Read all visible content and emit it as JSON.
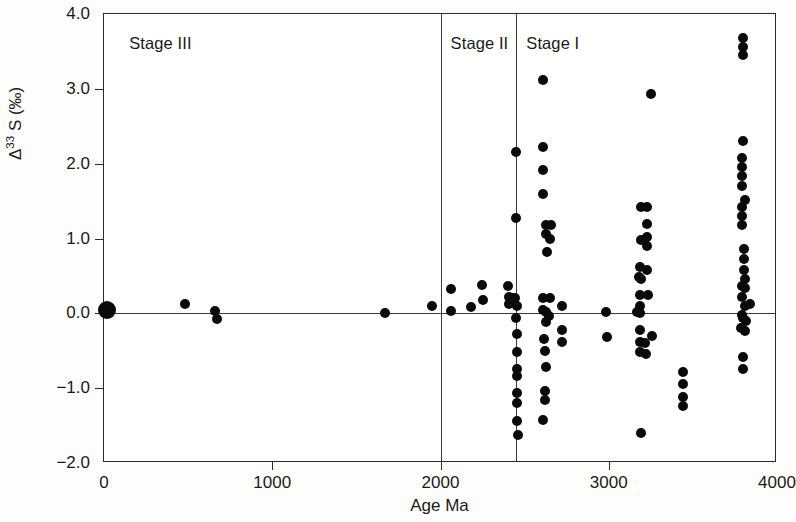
{
  "chart_data": {
    "type": "scatter",
    "title": "",
    "xlabel": "Age Ma",
    "ylabel": "Δ33 S (‰)",
    "ylabel_base": "Δ",
    "ylabel_sup": "33",
    "ylabel_rest": " S (‰)",
    "xlim": [
      0,
      4000
    ],
    "ylim": [
      -2.0,
      4.0
    ],
    "xticks": [
      0,
      1000,
      2000,
      3000,
      4000
    ],
    "xtick_labels": [
      "0",
      "1000",
      "2000",
      "3000",
      "4000"
    ],
    "yticks": [
      -2.0,
      -1.0,
      0.0,
      1.0,
      2.0,
      3.0,
      4.0
    ],
    "ytick_labels": [
      "-2.0",
      "-1.0",
      "0.0",
      "1.0",
      "2.0",
      "3.0",
      "4.0"
    ],
    "grid": false,
    "legend": null,
    "zero_line": 0.0,
    "point_color": "#0a0a0a",
    "frame_color": "#2b2b2b",
    "annotations": [
      {
        "name": "stage-iii-label",
        "text": "Stage III",
        "x": 150,
        "y": 3.72
      },
      {
        "name": "stage-ii-label",
        "text": "Stage II",
        "x": 2060,
        "y": 3.72
      },
      {
        "name": "stage-i-label",
        "text": "Stage I",
        "x": 2510,
        "y": 3.72
      }
    ],
    "dividers": [
      {
        "name": "stage-iii-ii-divider",
        "x": 2000
      },
      {
        "name": "stage-ii-i-divider",
        "x": 2450
      }
    ],
    "series": [
      {
        "name": "Phanerozoic-Proterozoic",
        "points": [
          {
            "x": 20,
            "y": 0.05,
            "r": 9
          },
          {
            "x": 480,
            "y": 0.13,
            "r": 5
          },
          {
            "x": 660,
            "y": 0.03,
            "r": 5
          },
          {
            "x": 672,
            "y": -0.07,
            "r": 5
          },
          {
            "x": 1670,
            "y": 0.0,
            "r": 5
          },
          {
            "x": 1950,
            "y": 0.1,
            "r": 5
          }
        ]
      },
      {
        "name": "Stage-II-2050-2450",
        "points": [
          {
            "x": 2060,
            "y": 0.32,
            "r": 5
          },
          {
            "x": 2062,
            "y": 0.03,
            "r": 5
          },
          {
            "x": 2180,
            "y": 0.08,
            "r": 5
          },
          {
            "x": 2245,
            "y": 0.38,
            "r": 5
          },
          {
            "x": 2250,
            "y": 0.18,
            "r": 5
          },
          {
            "x": 2400,
            "y": 0.36,
            "r": 5
          },
          {
            "x": 2405,
            "y": 0.22,
            "r": 5
          },
          {
            "x": 2410,
            "y": 0.12,
            "r": 5
          },
          {
            "x": 2432,
            "y": 0.2,
            "r": 5
          },
          {
            "x": 2445,
            "y": 0.2,
            "r": 5
          },
          {
            "x": 2450,
            "y": -0.06,
            "r": 5
          }
        ]
      },
      {
        "name": "Stage-I-2450-boundary-column",
        "points": [
          {
            "x": 2450,
            "y": 2.16,
            "r": 5
          },
          {
            "x": 2450,
            "y": 1.28,
            "r": 5
          },
          {
            "x": 2455,
            "y": 0.1,
            "r": 5
          },
          {
            "x": 2455,
            "y": -0.28,
            "r": 5
          },
          {
            "x": 2455,
            "y": -0.52,
            "r": 5
          },
          {
            "x": 2455,
            "y": -0.74,
            "r": 5
          },
          {
            "x": 2455,
            "y": -0.84,
            "r": 5
          },
          {
            "x": 2455,
            "y": -1.06,
            "r": 5
          },
          {
            "x": 2455,
            "y": -1.2,
            "r": 5
          },
          {
            "x": 2455,
            "y": -1.44,
            "r": 5
          },
          {
            "x": 2458,
            "y": -1.62,
            "r": 5
          }
        ]
      },
      {
        "name": "Stage-I-2550-2750",
        "points": [
          {
            "x": 2608,
            "y": 3.12,
            "r": 5
          },
          {
            "x": 2608,
            "y": 2.22,
            "r": 5
          },
          {
            "x": 2608,
            "y": 1.92,
            "r": 5
          },
          {
            "x": 2610,
            "y": 1.6,
            "r": 5
          },
          {
            "x": 2630,
            "y": 1.18,
            "r": 5
          },
          {
            "x": 2655,
            "y": 1.18,
            "r": 5
          },
          {
            "x": 2625,
            "y": 1.06,
            "r": 5
          },
          {
            "x": 2648,
            "y": 1.0,
            "r": 5
          },
          {
            "x": 2632,
            "y": 0.82,
            "r": 5
          },
          {
            "x": 2610,
            "y": 0.2,
            "r": 5
          },
          {
            "x": 2648,
            "y": 0.2,
            "r": 5
          },
          {
            "x": 2612,
            "y": 0.04,
            "r": 5
          },
          {
            "x": 2630,
            "y": 0.02,
            "r": 5
          },
          {
            "x": 2645,
            "y": -0.04,
            "r": 5
          },
          {
            "x": 2625,
            "y": -0.12,
            "r": 5
          },
          {
            "x": 2618,
            "y": -0.34,
            "r": 5
          },
          {
            "x": 2620,
            "y": -0.5,
            "r": 5
          },
          {
            "x": 2625,
            "y": -0.72,
            "r": 5
          },
          {
            "x": 2622,
            "y": -1.04,
            "r": 5
          },
          {
            "x": 2624,
            "y": -1.16,
            "r": 5
          },
          {
            "x": 2612,
            "y": -1.42,
            "r": 5
          },
          {
            "x": 2720,
            "y": 0.1,
            "r": 5
          },
          {
            "x": 2722,
            "y": -0.22,
            "r": 5
          },
          {
            "x": 2722,
            "y": -0.38,
            "r": 5
          }
        ]
      },
      {
        "name": "Stage-I-2950-3050",
        "points": [
          {
            "x": 2985,
            "y": 0.02,
            "r": 5
          },
          {
            "x": 2990,
            "y": -0.32,
            "r": 5
          }
        ]
      },
      {
        "name": "Stage-I-3150-3300",
        "points": [
          {
            "x": 3250,
            "y": 2.93,
            "r": 5
          },
          {
            "x": 3190,
            "y": 1.42,
            "r": 5
          },
          {
            "x": 3225,
            "y": 1.42,
            "r": 5
          },
          {
            "x": 3228,
            "y": 1.2,
            "r": 5
          },
          {
            "x": 3228,
            "y": 1.02,
            "r": 5
          },
          {
            "x": 3192,
            "y": 0.98,
            "r": 5
          },
          {
            "x": 3228,
            "y": 0.9,
            "r": 5
          },
          {
            "x": 3185,
            "y": 0.62,
            "r": 5
          },
          {
            "x": 3225,
            "y": 0.58,
            "r": 5
          },
          {
            "x": 3178,
            "y": 0.48,
            "r": 5
          },
          {
            "x": 3190,
            "y": 0.46,
            "r": 5
          },
          {
            "x": 3188,
            "y": 0.24,
            "r": 5
          },
          {
            "x": 3232,
            "y": 0.24,
            "r": 5
          },
          {
            "x": 3186,
            "y": 0.1,
            "r": 5
          },
          {
            "x": 3165,
            "y": 0.02,
            "r": 5
          },
          {
            "x": 3188,
            "y": 0.0,
            "r": 5
          },
          {
            "x": 3188,
            "y": -0.22,
            "r": 5
          },
          {
            "x": 3188,
            "y": -0.38,
            "r": 5
          },
          {
            "x": 3218,
            "y": -0.4,
            "r": 5
          },
          {
            "x": 3186,
            "y": -0.52,
            "r": 5
          },
          {
            "x": 3222,
            "y": -0.54,
            "r": 5
          },
          {
            "x": 3258,
            "y": -0.3,
            "r": 5
          },
          {
            "x": 3190,
            "y": -1.6,
            "r": 5
          }
        ]
      },
      {
        "name": "Stage-I-3400-3500",
        "points": [
          {
            "x": 3440,
            "y": -0.78,
            "r": 5
          },
          {
            "x": 3440,
            "y": -0.94,
            "r": 5
          },
          {
            "x": 3440,
            "y": -1.12,
            "r": 5
          },
          {
            "x": 3442,
            "y": -1.24,
            "r": 5
          }
        ]
      },
      {
        "name": "Stage-I-3700-3900",
        "points": [
          {
            "x": 3800,
            "y": 3.68,
            "r": 5
          },
          {
            "x": 3800,
            "y": 3.56,
            "r": 5
          },
          {
            "x": 3800,
            "y": 3.45,
            "r": 5
          },
          {
            "x": 3800,
            "y": 2.3,
            "r": 5
          },
          {
            "x": 3793,
            "y": 2.08,
            "r": 5
          },
          {
            "x": 3793,
            "y": 1.96,
            "r": 5
          },
          {
            "x": 3793,
            "y": 1.84,
            "r": 5
          },
          {
            "x": 3793,
            "y": 1.7,
            "r": 5
          },
          {
            "x": 3812,
            "y": 1.52,
            "r": 5
          },
          {
            "x": 3793,
            "y": 1.42,
            "r": 5
          },
          {
            "x": 3793,
            "y": 1.3,
            "r": 5
          },
          {
            "x": 3793,
            "y": 1.18,
            "r": 5
          },
          {
            "x": 3805,
            "y": 0.86,
            "r": 5
          },
          {
            "x": 3805,
            "y": 0.72,
            "r": 5
          },
          {
            "x": 3805,
            "y": 0.58,
            "r": 5
          },
          {
            "x": 3808,
            "y": 0.46,
            "r": 5
          },
          {
            "x": 3790,
            "y": 0.36,
            "r": 5
          },
          {
            "x": 3812,
            "y": 0.34,
            "r": 5
          },
          {
            "x": 3790,
            "y": 0.22,
            "r": 5
          },
          {
            "x": 3808,
            "y": 0.1,
            "r": 5
          },
          {
            "x": 3838,
            "y": 0.12,
            "r": 5
          },
          {
            "x": 3790,
            "y": -0.02,
            "r": 5
          },
          {
            "x": 3800,
            "y": -0.06,
            "r": 5
          },
          {
            "x": 3816,
            "y": -0.1,
            "r": 5
          },
          {
            "x": 3788,
            "y": -0.2,
            "r": 5
          },
          {
            "x": 3812,
            "y": -0.24,
            "r": 5
          },
          {
            "x": 3800,
            "y": -0.58,
            "r": 5
          },
          {
            "x": 3800,
            "y": -0.74,
            "r": 5
          }
        ]
      }
    ]
  }
}
